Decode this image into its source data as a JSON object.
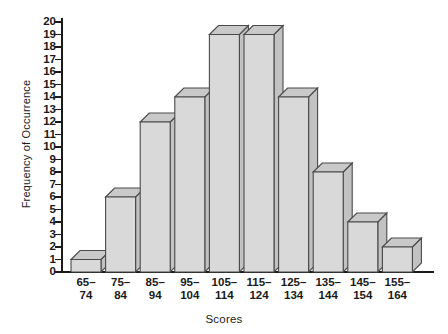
{
  "chart_data": {
    "type": "bar",
    "title": "",
    "xlabel": "Scores",
    "ylabel": "Frequency of Occurrence",
    "categories": [
      "65–74",
      "75–84",
      "85–94",
      "95–104",
      "105–114",
      "115–124",
      "125–134",
      "135–144",
      "145–154",
      "155–164"
    ],
    "category_lines": [
      [
        "65–",
        "74"
      ],
      [
        "75–",
        "84"
      ],
      [
        "85–",
        "94"
      ],
      [
        "95–",
        "104"
      ],
      [
        "105–",
        "114"
      ],
      [
        "115–",
        "124"
      ],
      [
        "125–",
        "134"
      ],
      [
        "135–",
        "144"
      ],
      [
        "145–",
        "154"
      ],
      [
        "155–",
        "164"
      ]
    ],
    "values": [
      1,
      6,
      12,
      14,
      19,
      19,
      14,
      8,
      4,
      2
    ],
    "ylim": [
      0,
      20
    ],
    "ytick_step": 1,
    "yticks": [
      20,
      19,
      18,
      17,
      16,
      15,
      14,
      13,
      12,
      11,
      10,
      9,
      8,
      7,
      6,
      5,
      4,
      3,
      2,
      1,
      0
    ],
    "grid": false,
    "legend": null,
    "style": "3d-bars",
    "colors": {
      "bar_front": "#d9d9d9",
      "bar_top": "#c9c9c9",
      "bar_side": "#c2c2c2",
      "bar_outline": "#4a4a4a",
      "axis": "#1a1a1a",
      "text": "#1a1a1a",
      "background": "#ffffff"
    }
  }
}
